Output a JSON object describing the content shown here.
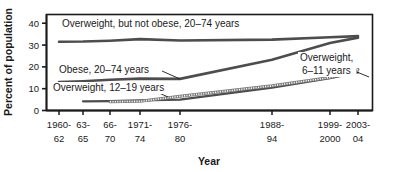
{
  "chart_data": {
    "type": "line",
    "title": "",
    "xlabel": "Year",
    "ylabel": "Percent of population",
    "ylim": [
      0,
      44
    ],
    "yticks": [
      0,
      10,
      20,
      30,
      40
    ],
    "ytick_labels": [
      "0",
      "10",
      "20",
      "30",
      "40"
    ],
    "grid": false,
    "legend": "inline-annotations",
    "categories": [
      "1960-62",
      "63-65",
      "66-70",
      "1971-74",
      "1976-80",
      "1988-94",
      "1999-2000",
      "2003-04"
    ],
    "category_lines": [
      [
        "1960-",
        "62"
      ],
      [
        "63-",
        "65"
      ],
      [
        "66-",
        "70"
      ],
      [
        "1971-",
        "74"
      ],
      [
        "1976-",
        "80"
      ],
      [
        "1988-",
        "94"
      ],
      [
        "1999-",
        "2000"
      ],
      [
        "2003-",
        "04"
      ]
    ],
    "series": [
      {
        "name": "Overweight, but not obese, 20-74 years",
        "style": "solid",
        "color": "#4d4d4d",
        "width": 2.6,
        "x": [
          "1960-62",
          "63-65",
          "66-70",
          "1971-74",
          "1976-80",
          "1988-94",
          "1999-2000",
          "2003-04"
        ],
        "values": [
          31.5,
          31.6,
          32.0,
          32.7,
          32.1,
          32.5,
          33.6,
          34.1
        ]
      },
      {
        "name": "Obese, 20-74 years",
        "style": "solid",
        "color": "#4d4d4d",
        "width": 2.6,
        "x": [
          "1960-62",
          "63-65",
          "66-70",
          "1971-74",
          "1976-80",
          "1988-94",
          "1999-2000",
          "2003-04"
        ],
        "values": [
          13.0,
          13.4,
          14.1,
          14.6,
          14.5,
          23.3,
          30.9,
          33.4
        ]
      },
      {
        "name": "Overweight, 12-19 years",
        "style": "solid",
        "color": "#4d4d4d",
        "width": 2.2,
        "x": [
          "63-65",
          "66-70",
          "1971-74",
          "1976-80",
          "1988-94",
          "1999-2000",
          "2003-04"
        ],
        "values": [
          4.2,
          4.3,
          4.6,
          5.0,
          10.5,
          14.8,
          17.4
        ]
      },
      {
        "name": "Overweight, 6-11 years",
        "style": "hatched",
        "color": "#7a7a7a",
        "width": 3.0,
        "x": [
          "66-70",
          "1971-74",
          "1976-80",
          "1988-94",
          "1999-2000",
          "2003-04"
        ],
        "values": [
          4.0,
          4.2,
          6.5,
          11.3,
          15.1,
          18.8
        ]
      }
    ],
    "annotations": [
      {
        "id": "ann-overweight-not-obese",
        "text": "Overweight, but not obese, 20–74 years",
        "x": 62,
        "y": 27,
        "anchor": "start",
        "leader": null
      },
      {
        "id": "ann-obese",
        "text": "Obese, 20–74 years",
        "x": 59,
        "y": 73,
        "anchor": "start",
        "leader": {
          "x1": 162,
          "y1": 71,
          "x2": 180,
          "y2": 79
        }
      },
      {
        "id": "ann-overweight-12-19",
        "text": "Overweight, 12–19 years",
        "x": 53,
        "y": 91,
        "anchor": "start",
        "leader": {
          "x1": 150,
          "y1": 89,
          "x2": 168,
          "y2": 97
        }
      },
      {
        "id": "ann-overweight-6-11-line1",
        "text": "Overweight,",
        "x": 300,
        "y": 61,
        "anchor": "start",
        "leader": null
      },
      {
        "id": "ann-overweight-6-11-line2",
        "text": "6–11 years",
        "x": 302,
        "y": 74,
        "anchor": "start",
        "leader": {
          "x1": 352,
          "y1": 70,
          "x2": 369,
          "y2": 77
        }
      }
    ]
  },
  "axes": {
    "y_axis_title": "Percent of population",
    "x_axis_title": "Year"
  }
}
